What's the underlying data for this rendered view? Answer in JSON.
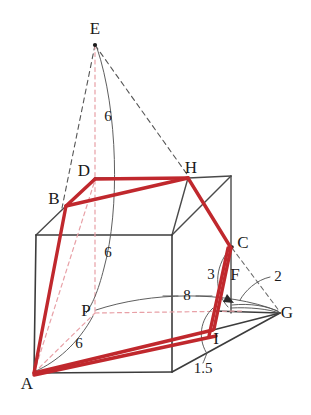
{
  "figure": {
    "background_color": "#ffffff",
    "colors": {
      "solid_edge": "#3c3c3c",
      "hidden_edge": "#555555",
      "section_red": "#c0282d",
      "dashed_pink": "#e8a0a6",
      "leader_gray": "#555555",
      "text": "#1a1a1a"
    },
    "vertex_labels": [
      {
        "name": "E",
        "text": "E",
        "x": 95,
        "y": 30
      },
      {
        "name": "D",
        "text": "D",
        "x": 84,
        "y": 172
      },
      {
        "name": "H",
        "text": "H",
        "x": 191,
        "y": 169
      },
      {
        "name": "B",
        "text": "B",
        "x": 54,
        "y": 200
      },
      {
        "name": "C",
        "text": "C",
        "x": 243,
        "y": 244
      },
      {
        "name": "F",
        "text": "F",
        "x": 235,
        "y": 276
      },
      {
        "name": "G",
        "text": "G",
        "x": 287,
        "y": 314
      },
      {
        "name": "P",
        "text": "P",
        "x": 86,
        "y": 312
      },
      {
        "name": "I",
        "text": "I",
        "x": 216,
        "y": 340
      },
      {
        "name": "A",
        "text": "A",
        "x": 27,
        "y": 385
      }
    ],
    "measure_labels": [
      {
        "name": "ep-upper-6",
        "text": "6",
        "x": 108,
        "y": 118
      },
      {
        "name": "dp-middle-6",
        "text": "6",
        "x": 108,
        "y": 254
      },
      {
        "name": "ap-lower-6",
        "text": "6",
        "x": 79,
        "y": 345
      },
      {
        "name": "pg-8",
        "text": "8",
        "x": 187,
        "y": 297
      },
      {
        "name": "cf-3",
        "text": "3",
        "x": 211,
        "y": 276
      },
      {
        "name": "fg-2",
        "text": "2",
        "x": 278,
        "y": 278
      },
      {
        "name": "ig-1point5",
        "text": "1.5",
        "x": 203,
        "y": 370
      }
    ],
    "dimensions": {
      "E_to_P_height": "6",
      "D_to_P": "6",
      "A_to_P": "6",
      "P_to_G": "8",
      "C_to_F": "3",
      "F_to_G": "2",
      "I_to_G": "1.5"
    }
  }
}
